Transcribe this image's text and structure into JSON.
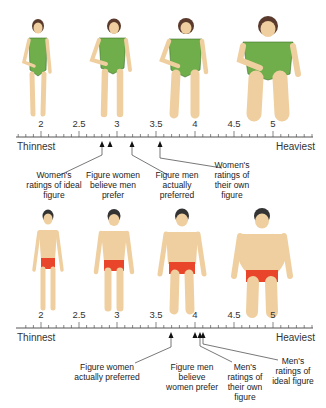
{
  "scale": {
    "min_label": "Thinnest",
    "max_label": "Heaviest",
    "ticks": [
      "2",
      "2.5",
      "3",
      "3.5",
      "4",
      "4.5",
      "5"
    ]
  },
  "women_panel": {
    "figures": [
      "woman-figure-1",
      "woman-figure-2",
      "woman-figure-3",
      "woman-figure-4"
    ],
    "annotations": [
      {
        "label": "Women's ratings of ideal figure",
        "value": 2.8
      },
      {
        "label": "Figure women believe men prefer",
        "value": 2.9
      },
      {
        "label": "Figure men actually preferred",
        "value": 3.2
      },
      {
        "label": "Women's ratings of their own figure",
        "value": 3.55
      }
    ]
  },
  "men_panel": {
    "figures": [
      "man-figure-1",
      "man-figure-2",
      "man-figure-3",
      "man-figure-4"
    ],
    "annotations": [
      {
        "label": "Figure women actually preferred",
        "value": 3.7
      },
      {
        "label": "Figure men believe women prefer",
        "value": 4.0
      },
      {
        "label": "Men's ratings of their own figure",
        "value": 4.07
      },
      {
        "label": "Men's ratings of ideal figure",
        "value": 4.1
      }
    ]
  },
  "colors": {
    "swimsuit": "#6fae4a",
    "trunks": "#e8452a",
    "skin": "#efcf9f",
    "hair": "#5a3a2c",
    "hair_men": "#333333"
  }
}
